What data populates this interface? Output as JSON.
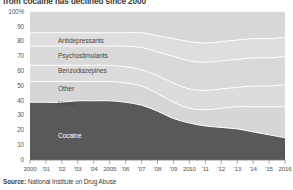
{
  "chart_data": {
    "type": "area",
    "stacked": true,
    "stacked_percent": true,
    "title": "from cocaine has declined since 2000",
    "subtitle": "",
    "xlabel": "",
    "ylabel": "",
    "ylim": [
      0,
      100
    ],
    "ytick_values": [
      0,
      10,
      20,
      30,
      40,
      50,
      60,
      70,
      80,
      90,
      100
    ],
    "ytick_labels": [
      "0",
      "10",
      "20",
      "30",
      "40",
      "50",
      "60",
      "70",
      "80",
      "90",
      "100%"
    ],
    "grid": false,
    "legend_position": "inline-labels",
    "x": [
      2000,
      2001,
      2002,
      2003,
      2004,
      2005,
      2006,
      2007,
      2008,
      2009,
      2010,
      2011,
      2012,
      2013,
      2014,
      2015,
      2016
    ],
    "xtick_labels": [
      "2000",
      "'01",
      "'02",
      "'03",
      "'04",
      "2005",
      "'06",
      "'07",
      "'08",
      "'09",
      "2010",
      "'11",
      "'12",
      "'13",
      "'14",
      "'15",
      "2016"
    ],
    "series": [
      {
        "name": "Cocaine",
        "color": "#595959",
        "values": [
          39,
          39,
          39,
          40,
          40,
          40,
          39,
          37,
          33,
          28,
          25,
          23,
          22,
          21,
          19,
          17,
          15
        ]
      },
      {
        "name": "Heroin",
        "color": "#d6d6d6",
        "values": [
          14,
          14,
          14,
          13,
          13,
          13,
          13,
          13,
          12,
          11,
          10,
          11,
          13,
          15,
          17,
          19,
          21
        ]
      },
      {
        "name": "Other",
        "color": "#dcdcdc",
        "values": [
          11,
          11,
          11,
          11,
          11,
          11,
          11,
          11,
          12,
          13,
          13,
          13,
          13,
          13,
          14,
          14,
          15
        ]
      },
      {
        "name": "Benzodiazepines",
        "color": "#d9d9d9",
        "values": [
          13,
          13,
          13,
          13,
          13,
          13,
          14,
          15,
          16,
          18,
          19,
          19,
          19,
          19,
          19,
          19,
          19
        ]
      },
      {
        "name": "Psychostimulants",
        "color": "#dedede",
        "values": [
          9,
          9,
          9,
          9,
          9,
          9,
          9,
          10,
          11,
          12,
          13,
          13,
          13,
          13,
          13,
          13,
          13
        ]
      },
      {
        "name": "Antidepressants",
        "color": "#d7d7d7",
        "values": [
          14,
          14,
          14,
          14,
          14,
          14,
          14,
          14,
          16,
          18,
          20,
          21,
          20,
          19,
          18,
          18,
          17
        ]
      }
    ],
    "series_label_positions": [
      {
        "name": "Antidepressants",
        "x": 58,
        "y": 30,
        "on_dark": false
      },
      {
        "name": "Psychostimulants",
        "x": 58,
        "y": 45,
        "on_dark": false
      },
      {
        "name": "Benzodiazepines",
        "x": 58,
        "y": 60,
        "on_dark": false
      },
      {
        "name": "Other",
        "x": 58,
        "y": 78,
        "on_dark": false
      },
      {
        "name": "Heroin",
        "x": 58,
        "y": 93,
        "on_dark": false
      },
      {
        "name": "Cocaine",
        "x": 58,
        "y": 125,
        "on_dark": true
      }
    ]
  },
  "source": {
    "prefix": "Source:",
    "text": " National Institute on Drug Abuse"
  }
}
